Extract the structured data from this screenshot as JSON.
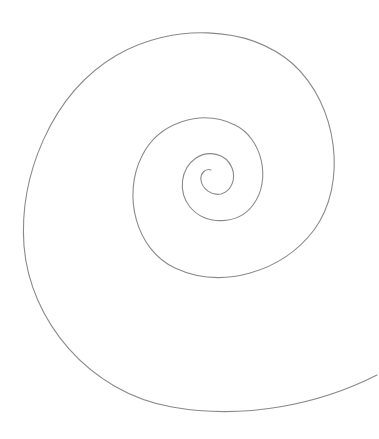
{
  "diagram": {
    "type": "golden spiral",
    "background": "#ffffff",
    "stroke_color": "#8a8a8a",
    "stroke_width": 1.1,
    "path": "M 211 170 C 205 168, 200 174, 201 180 C 202 189, 212 196, 221 194 C 232 191, 236 178, 232 168 C 226 153, 208 150, 196 158 C 180 169, 178 192, 190 207 C 206 226, 238 225, 253 205 C 272 180, 262 138, 235 125 C 201 108, 158 123, 142 156 C 122 195, 136 250, 175 268 C 222 290, 282 272, 314 230 C 348 184, 338 105, 293 64 C 247 24, 170 24, 117 55 C 50 94, 19 178, 24 246 C 30 320, 88 392, 172 407 C 245 420, 320 404, 377 375"
  }
}
